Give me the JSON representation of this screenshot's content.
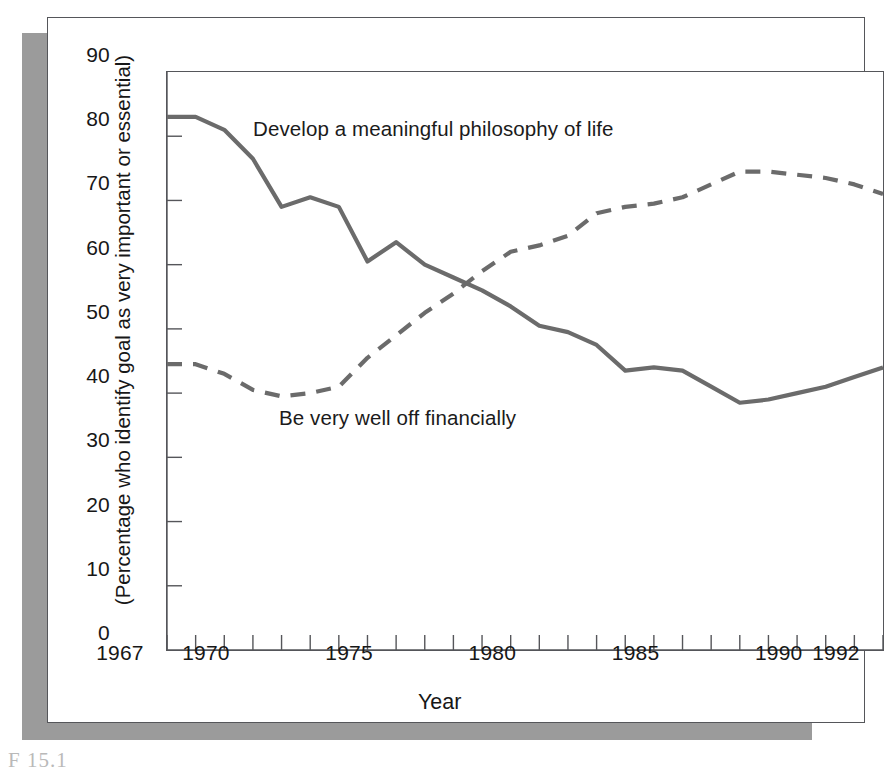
{
  "figure": {
    "caption": "F                  15.1"
  },
  "chart_data": {
    "type": "line",
    "title": "",
    "xlabel": "Year",
    "ylabel": "(Percentage who identify goal as very important or essential)",
    "xlim": [
      1967,
      1992
    ],
    "ylim": [
      0,
      90
    ],
    "ytick_step": 10,
    "xtick_step": 1,
    "grid": false,
    "legend": "inline-annotations",
    "ytick_labels": [
      "0",
      "10",
      "20",
      "30",
      "40",
      "50",
      "60",
      "70",
      "80",
      "90"
    ],
    "ytick_values": [
      0,
      10,
      20,
      30,
      40,
      50,
      60,
      70,
      80,
      90
    ],
    "xtick_labels": [
      "1967",
      "1970",
      "1975",
      "1980",
      "1985",
      "1990",
      "1992"
    ],
    "xtick_label_values": [
      1967,
      1970,
      1975,
      1980,
      1985,
      1990,
      1992
    ],
    "x": [
      1967,
      1968,
      1969,
      1970,
      1971,
      1972,
      1973,
      1974,
      1975,
      1976,
      1977,
      1978,
      1979,
      1980,
      1981,
      1982,
      1983,
      1984,
      1985,
      1986,
      1987,
      1988,
      1989,
      1990,
      1991,
      1992
    ],
    "series": [
      {
        "name": "Develop a meaningful philosophy of life",
        "style": "solid",
        "color": "#6b6b6b",
        "label_x": 1974,
        "label_y": 84,
        "values": [
          83,
          83,
          81,
          76.5,
          69,
          70.5,
          69,
          60.5,
          63.5,
          60,
          58,
          56,
          53.5,
          50.5,
          49.5,
          47.5,
          43.5,
          44,
          43.5,
          41,
          38.5,
          39,
          40,
          41,
          42.5,
          44
        ]
      },
      {
        "name": "Be very well off financially",
        "style": "dashed",
        "color": "#6b6b6b",
        "label_x": 1973,
        "label_y": 36,
        "values": [
          44.5,
          44.5,
          43,
          40.5,
          39.5,
          40,
          41,
          45.5,
          49,
          52.5,
          55.5,
          59,
          62,
          63,
          64.5,
          68,
          69,
          69.5,
          70.5,
          72.5,
          74.5,
          74.5,
          74,
          73.5,
          72.5,
          71
        ]
      }
    ],
    "annotations": [
      {
        "text": "Develop a meaningful philosophy of life",
        "series": 0
      },
      {
        "text": "Be very well off financially",
        "series": 1
      }
    ]
  }
}
